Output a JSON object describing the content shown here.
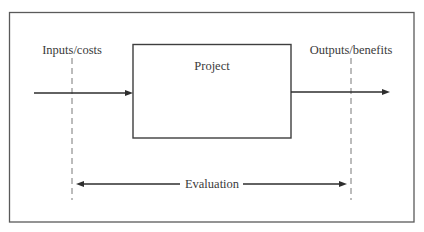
{
  "diagram": {
    "project_box": {
      "label": "Project"
    },
    "inputs": {
      "label": "Inputs/costs"
    },
    "outputs": {
      "label": "Outputs/benefits"
    },
    "evaluation": {
      "label": "Evaluation"
    },
    "colors": {
      "stroke": "#3e3e3e",
      "text": "#3a3a3a",
      "background": "#ffffff"
    },
    "edges": [
      {
        "from": "inputs",
        "to": "project",
        "type": "arrow"
      },
      {
        "from": "project",
        "to": "outputs",
        "type": "arrow"
      },
      {
        "from": "inputs-boundary",
        "to": "outputs-boundary",
        "type": "double-arrow",
        "label": "Evaluation"
      }
    ]
  }
}
